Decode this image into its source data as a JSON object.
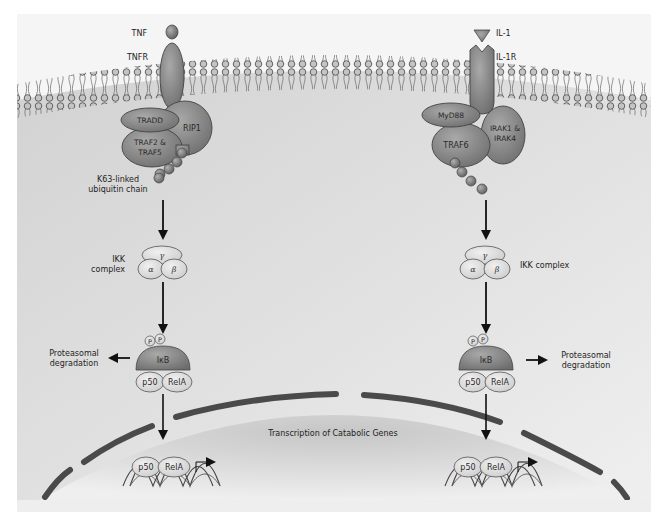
{
  "figure": {
    "colors": {
      "background_cell": "#d9d9d9",
      "extracellular": "#f4f4f4",
      "protein_fill": "#8a8a8a",
      "protein_dark": "#555555",
      "complex_fill": "#e2e2e2",
      "nuclear_envelope": "#4a4a4a",
      "arrow": "#111111"
    }
  },
  "left_pathway": {
    "ligand": "TNF",
    "receptor": "TNFR",
    "adaptors": {
      "tradd": "TRADD",
      "traf": "TRAF2 &",
      "traf_line2": "TRAF5",
      "rip": "RIP1"
    },
    "ubiquitin_label_line1": "K63-linked",
    "ubiquitin_label_line2": "ubiquitin chain",
    "ikk_label_line1": "IKK",
    "ikk_label_line2": "complex",
    "ikk_subunits": {
      "gamma": "γ",
      "alpha": "α",
      "beta": "β"
    },
    "phospho": [
      "P",
      "P"
    ],
    "ikb": "IκB",
    "p50": "p50",
    "rela": "RelA",
    "degradation_line1": "Proteasomal",
    "degradation_line2": "degradation",
    "nuclear_p50": "p50",
    "nuclear_rela": "RelA"
  },
  "right_pathway": {
    "ligand": "IL-1",
    "receptor": "IL-1R",
    "adaptors": {
      "myd88": "MyD88",
      "traf6": "TRAF6",
      "irak": "IRAK1 &",
      "irak_line2": "IRAK4"
    },
    "ikk_label": "IKK complex",
    "ikk_subunits": {
      "gamma": "γ",
      "alpha": "α",
      "beta": "β"
    },
    "phospho": [
      "P",
      "P"
    ],
    "ikb": "IκB",
    "p50": "p50",
    "rela": "RelA",
    "degradation_line1": "Proteasomal",
    "degradation_line2": "degradation",
    "nuclear_p50": "p50",
    "nuclear_rela": "RelA"
  },
  "nucleus": {
    "label": "Transcription of Catabolic Genes"
  }
}
